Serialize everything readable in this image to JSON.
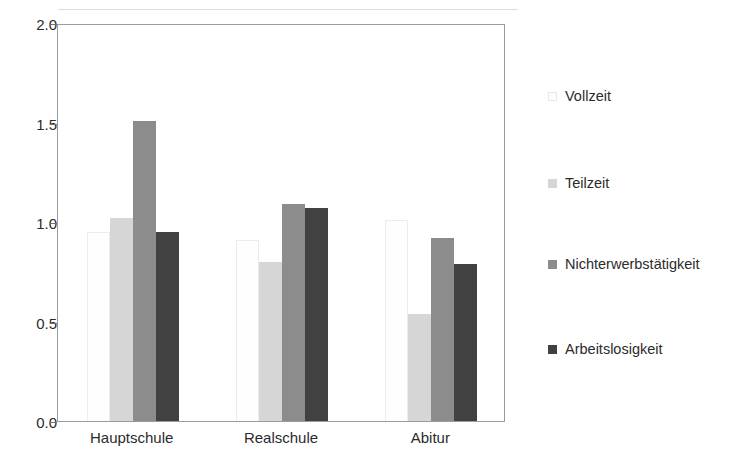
{
  "chart_data": {
    "type": "bar",
    "title": "",
    "subtitle": "",
    "xlabel": "",
    "ylabel": "",
    "categories": [
      "Hauptschule",
      "Realschule",
      "Abitur"
    ],
    "series": [
      {
        "name": "Vollzeit",
        "color": "#fefefe",
        "values": [
          0.95,
          0.91,
          1.01
        ]
      },
      {
        "name": "Teilzeit",
        "color": "#d6d6d6",
        "values": [
          1.02,
          0.8,
          0.54
        ]
      },
      {
        "name": "Nichterwerbstätigkeit",
        "color": "#8c8c8c",
        "values": [
          1.51,
          1.09,
          0.92
        ]
      },
      {
        "name": "Arbeitslosigkeit",
        "color": "#414141",
        "values": [
          0.95,
          1.07,
          0.79
        ]
      }
    ],
    "ylim": [
      0.0,
      2.0
    ],
    "yticks": [
      0.0,
      0.5,
      1.0,
      1.5,
      2.0
    ],
    "ytick_labels": [
      "0.0",
      "0.5",
      "1.0",
      "1.5",
      "2.0"
    ],
    "grid": false,
    "legend_position": "right",
    "frame": true,
    "annotations": []
  },
  "legend": {
    "entries": [
      {
        "label": "Vollzeit"
      },
      {
        "label": "Teilzeit"
      },
      {
        "label": "Nichterwerbstätigkeit"
      },
      {
        "label": "Arbeitslosigkeit"
      }
    ]
  }
}
